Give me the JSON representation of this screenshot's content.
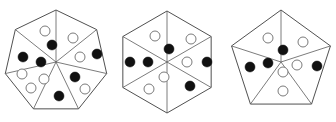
{
  "figure": {
    "background_color": "#ffffff",
    "outline_color": "#3c3c3c",
    "spoke_color": "#5a5a5a",
    "filled_dot_color": "#111111",
    "open_dot_fill": "#ffffff",
    "open_dot_stroke": "#7a7a7a",
    "dot_radius": 5.0,
    "shapes": [
      {
        "name": "heptagon",
        "label": "Heptagon",
        "sides": 7,
        "center": [
          56,
          62
        ],
        "radius": 52,
        "rotation_deg": -90,
        "sector_count": 7,
        "filled_dots": 6,
        "open_dots": 7,
        "dots": [
          {
            "type": "open",
            "x": 45,
            "y": 31
          },
          {
            "type": "filled",
            "x": 52,
            "y": 45
          },
          {
            "type": "open",
            "x": 73,
            "y": 38
          },
          {
            "type": "open",
            "x": 80,
            "y": 57
          },
          {
            "type": "filled",
            "x": 97,
            "y": 54
          },
          {
            "type": "filled",
            "x": 75,
            "y": 77
          },
          {
            "type": "open",
            "x": 85,
            "y": 89
          },
          {
            "type": "filled",
            "x": 59,
            "y": 96
          },
          {
            "type": "open",
            "x": 44,
            "y": 79
          },
          {
            "type": "open",
            "x": 31,
            "y": 88
          },
          {
            "type": "filled",
            "x": 41,
            "y": 62
          },
          {
            "type": "filled",
            "x": 23,
            "y": 57
          },
          {
            "type": "open",
            "x": 22,
            "y": 74
          }
        ]
      },
      {
        "name": "hexagon",
        "label": "Hexagon",
        "sides": 6,
        "center": [
          167,
          62
        ],
        "radius": 51,
        "rotation_deg": -90,
        "sector_count": 6,
        "filled_dots": 5,
        "open_dots": 6,
        "dots": [
          {
            "type": "open",
            "x": 155,
            "y": 36
          },
          {
            "type": "filled",
            "x": 169,
            "y": 49
          },
          {
            "type": "open",
            "x": 191,
            "y": 39
          },
          {
            "type": "open",
            "x": 187,
            "y": 62
          },
          {
            "type": "filled",
            "x": 207,
            "y": 62
          },
          {
            "type": "filled",
            "x": 190,
            "y": 86
          },
          {
            "type": "open",
            "x": 164,
            "y": 77
          },
          {
            "type": "open",
            "x": 149,
            "y": 89
          },
          {
            "type": "filled",
            "x": 148,
            "y": 62
          },
          {
            "type": "filled",
            "x": 130,
            "y": 62
          }
        ]
      },
      {
        "name": "pentagon",
        "label": "Pentagon",
        "sides": 5,
        "center": [
          281,
          62
        ],
        "radius": 52,
        "rotation_deg": -90,
        "sector_count": 5,
        "filled_dots": 4,
        "open_dots": 6,
        "dots": [
          {
            "type": "open",
            "x": 268,
            "y": 38
          },
          {
            "type": "filled",
            "x": 283,
            "y": 50
          },
          {
            "type": "open",
            "x": 303,
            "y": 42
          },
          {
            "type": "open",
            "x": 297,
            "y": 65
          },
          {
            "type": "filled",
            "x": 317,
            "y": 66
          },
          {
            "type": "open",
            "x": 283,
            "y": 72
          },
          {
            "type": "open",
            "x": 283,
            "y": 91
          },
          {
            "type": "filled",
            "x": 268,
            "y": 63
          },
          {
            "type": "filled",
            "x": 250,
            "y": 67
          }
        ]
      }
    ]
  }
}
